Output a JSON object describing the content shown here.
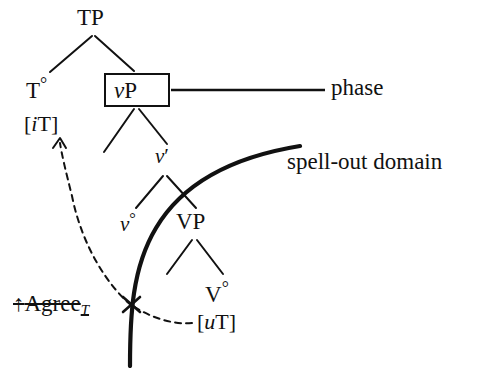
{
  "figure": {
    "type": "syntax-tree-diagram",
    "width": 480,
    "height": 368,
    "background_color": "#ffffff",
    "ink_color": "#111111"
  },
  "tree": {
    "nodes": [
      {
        "id": "TP",
        "label": "TP",
        "x": 93,
        "y": 18
      },
      {
        "id": "T0",
        "label": "T",
        "suffix": "°",
        "x": 40,
        "y": 88
      },
      {
        "id": "vP",
        "label": "P",
        "prefix": "v",
        "boxed": true,
        "x": 137,
        "y": 90
      },
      {
        "id": "vbar",
        "label": "′",
        "prefix": "v",
        "x": 165,
        "y": 158
      },
      {
        "id": "v0",
        "label": "",
        "prefix": "v",
        "suffix": "°",
        "x": 132,
        "y": 223
      },
      {
        "id": "VP",
        "label": "VP",
        "x": 195,
        "y": 222
      },
      {
        "id": "V0",
        "label": "V",
        "suffix": "°",
        "x": 219,
        "y": 292
      }
    ],
    "labels": {
      "tp": "TP",
      "t_head": "T",
      "t_head_degree": "°",
      "vp_little_v": "v",
      "vp_p": "P",
      "v_bar_little_v": "v",
      "v_bar_prime": "′",
      "v_head_little_v": "v",
      "v_head_degree": "°",
      "VP": "VP",
      "V_head": "V",
      "V_head_degree": "°"
    }
  },
  "features": {
    "interpretable_tense": {
      "open": "[",
      "marker": "i",
      "feature": "T",
      "close": "]",
      "full_text": "[iT]"
    },
    "uninterpretable_tense": {
      "open": "[",
      "marker": "u",
      "feature": "T",
      "close": "]",
      "full_text": "[uT]"
    }
  },
  "annotations": {
    "phase": {
      "text": "phase",
      "leader_line": true
    },
    "spell_out_domain": {
      "text": "spell-out domain",
      "boundary": "thick-curve"
    },
    "blocked_agree": {
      "arrow": "↑",
      "text": "Agree",
      "subscript": "T",
      "struck_through": true,
      "full_text": "↑Agree"
    }
  },
  "marks": {
    "blocking_cross": "✕",
    "dashed_arrow_target": "[iT]",
    "dashed_arrow_source": "[uT]"
  }
}
